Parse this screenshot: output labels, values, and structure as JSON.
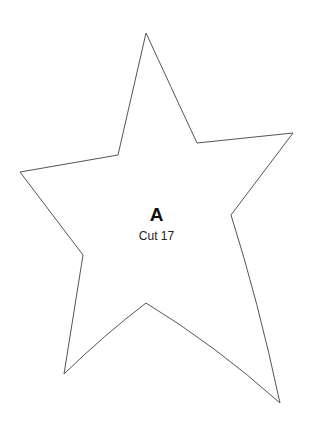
{
  "pattern": {
    "shape": "star",
    "piece_letter": "A",
    "cut_label": "Cut 17",
    "stroke_color": "#555555",
    "fill_color": "#ffffff"
  }
}
